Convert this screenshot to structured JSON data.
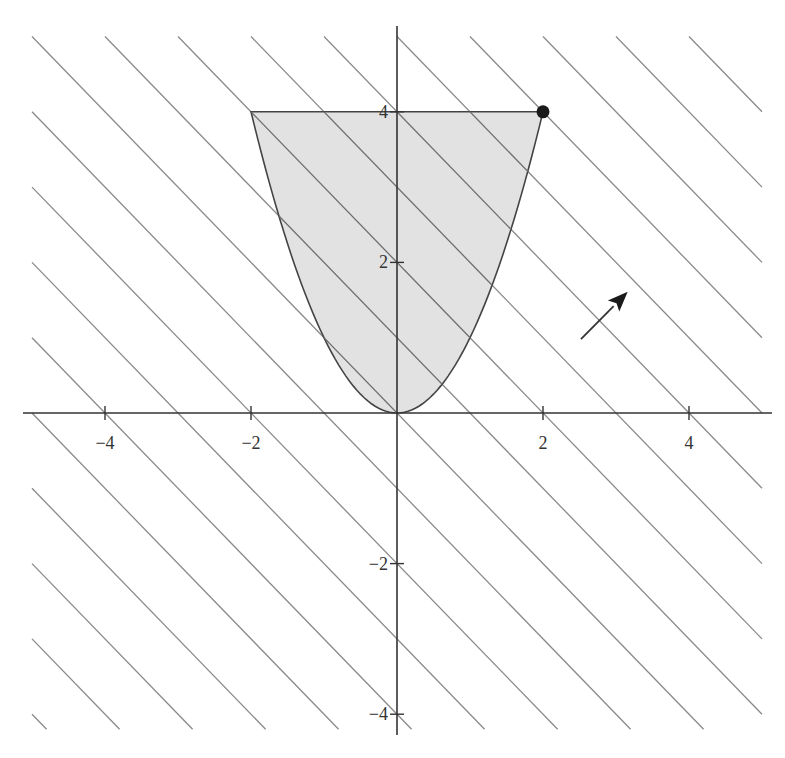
{
  "diagram": {
    "type": "feasible-region-plot",
    "axes": {
      "x": {
        "range": [
          -5,
          5
        ],
        "ticks": [
          -4,
          -2,
          2,
          4
        ],
        "tick_labels": [
          "−4",
          "−2",
          "2",
          "4"
        ]
      },
      "y": {
        "range": [
          -4.2,
          5
        ],
        "ticks": [
          -4,
          -2,
          2,
          4
        ],
        "tick_labels": [
          "−4",
          "−2",
          "2",
          "4"
        ]
      }
    },
    "region": {
      "lower_boundary": "y = x^2",
      "upper_boundary": "y = 4",
      "x_range": [
        -2,
        2
      ],
      "fill_color": "#e2e2e2",
      "stroke_color": "#444444"
    },
    "level_lines": {
      "equation": "x + y = c",
      "c_values": [
        -9,
        -8,
        -7,
        -6,
        -5,
        -4,
        -3,
        -2,
        -1,
        0,
        1,
        2,
        3,
        4,
        5,
        6,
        7,
        8,
        9
      ],
      "clip_box": {
        "xmin": -5,
        "xmax": 5,
        "ymin": -4.2,
        "ymax": 5
      },
      "color": "#8a8a8a"
    },
    "optimal_point": {
      "x": 2,
      "y": 4,
      "color": "#1a1a1a"
    },
    "gradient_arrow": {
      "from": [
        2.52,
        0.98
      ],
      "to": [
        3.16,
        1.61
      ],
      "color": "#333333"
    },
    "colors": {
      "axis": "#333333",
      "background": "#ffffff"
    }
  },
  "chart_data": {
    "type": "area",
    "title": "",
    "xlabel": "",
    "ylabel": "",
    "xlim": [
      -5,
      5
    ],
    "ylim": [
      -4.2,
      5
    ],
    "grid": false,
    "series": [
      {
        "name": "y = x^2 (lower boundary)",
        "x": [
          -2,
          -1,
          0,
          1,
          2
        ],
        "values": [
          4,
          1,
          0,
          1,
          4
        ]
      },
      {
        "name": "y = 4 (upper boundary)",
        "x": [
          -2,
          2
        ],
        "values": [
          4,
          4
        ]
      }
    ],
    "annotations": [
      {
        "type": "point",
        "x": 2,
        "y": 4,
        "label": ""
      },
      {
        "type": "arrow",
        "from": [
          2.52,
          0.98
        ],
        "to": [
          3.16,
          1.61
        ],
        "label": ""
      },
      {
        "type": "lines",
        "label": "x + y = c, c = -9 ... 9"
      }
    ]
  }
}
